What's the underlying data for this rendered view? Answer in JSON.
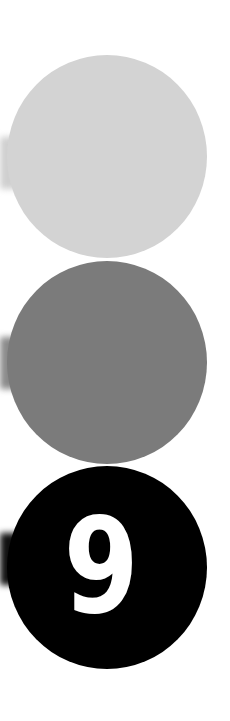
{
  "markers": [
    {
      "label": "",
      "color": "#d3d3d3",
      "tab_color": "#cfcfcf",
      "state": "inactive"
    },
    {
      "label": "",
      "color": "#7b7b7b",
      "tab_color": "#8a8a8a",
      "state": "inactive"
    },
    {
      "label": "9",
      "color": "#000000",
      "tab_color": "#111111",
      "text_color": "#ffffff",
      "state": "active"
    }
  ]
}
